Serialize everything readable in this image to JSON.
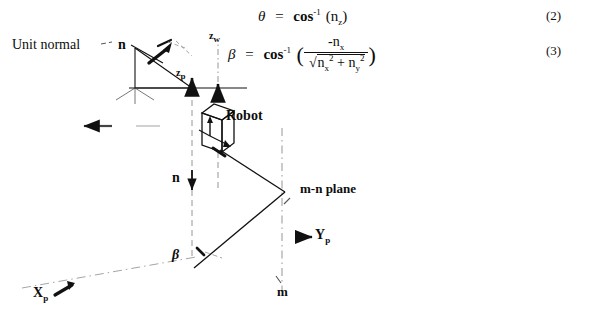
{
  "figure": {
    "type": "technical-diagram",
    "equations": [
      {
        "id": "equation-theta",
        "number": "(2)",
        "lhs": "θ",
        "relation": "=",
        "rhs_function": "cos",
        "rhs_exponent": "-1",
        "rhs_argument": "n",
        "rhs_argument_subscript": "z",
        "plain": "θ = cos^-1 (n_z)"
      },
      {
        "id": "equation-beta",
        "number": "(3)",
        "lhs": "β",
        "relation": "=",
        "rhs_function": "cos",
        "rhs_exponent": "-1",
        "numerator": "-n",
        "numerator_subscript": "x",
        "denominator_terms": [
          "n",
          "x",
          "2",
          "n",
          "y",
          "2"
        ],
        "denominator_plain": "√(n_x² + n_y²)",
        "plain": "β = cos^-1 ( -n_x / √(n_x² + n_y²) )"
      }
    ],
    "labels": {
      "unit_normal": "Unit normal",
      "n_top": "n",
      "z_world": "z",
      "z_world_sub": "w",
      "z_platform": "z",
      "z_platform_sub": "p",
      "robot": "Robot",
      "n_mid": "n",
      "mn_plane": "m-n plane",
      "y_platform": "Y",
      "y_platform_sub": "p",
      "beta": "β",
      "x_platform": "X",
      "x_platform_sub": "p",
      "m_axis": "m"
    },
    "colors": {
      "ink": "#0d0d0d",
      "background": "#ffffff",
      "faint": "#9a9a9a"
    }
  }
}
